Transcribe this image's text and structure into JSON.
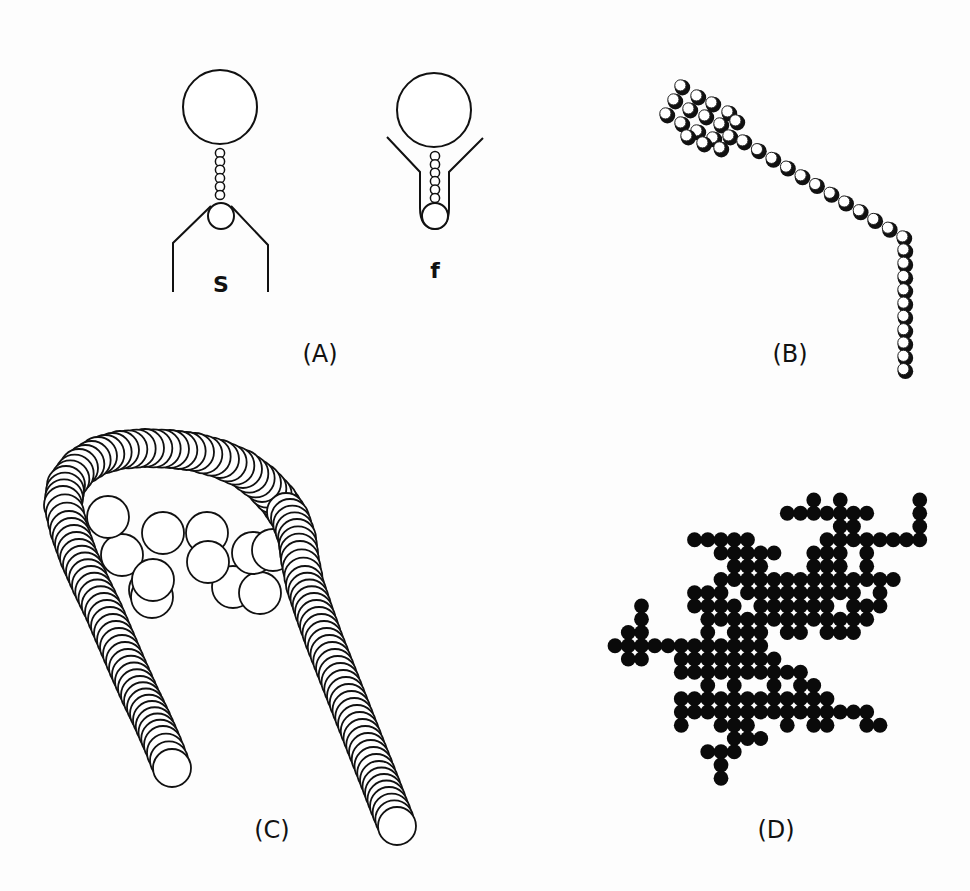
{
  "figure": {
    "stroke_color": "#111111",
    "fill_color": "#ffffff",
    "dot_color": "#0a0a0a",
    "background": "#fdfdfd"
  },
  "panels": {
    "A": {
      "label": "(A)",
      "label_pos": [
        320,
        362
      ],
      "figures": [
        {
          "sublabel": "S",
          "sublabel_pos": [
            221,
            292
          ],
          "head": {
            "cx": 220,
            "cy": 107,
            "r": 37
          },
          "neck_beads": {
            "x": 220,
            "y_start": 153,
            "y_step": 8.4,
            "count": 6,
            "r": 4.6
          },
          "base_bead": {
            "cx": 221,
            "cy": 216,
            "r": 13
          },
          "sheath_path": "M173,292 L173,243 L211,206 M268,292 L268,245 L231,206"
        },
        {
          "sublabel": "f",
          "sublabel_pos": [
            435,
            278
          ],
          "head": {
            "cx": 434,
            "cy": 110,
            "r": 37
          },
          "neck_beads": {
            "x": 435,
            "y_start": 156,
            "y_step": 8.4,
            "count": 6,
            "r": 4.6
          },
          "base_bead": {
            "cx": 435,
            "cy": 216,
            "r": 13
          },
          "sheath_path": "M387,137 L420,172 L420,208 Q420,228 435,229 M483,138 L449,172 L449,208 Q449,228 435,229"
        }
      ]
    },
    "B": {
      "label": "(B)",
      "label_pos": [
        790,
        362
      ],
      "bead_r": 7.2,
      "cluster_rows": [
        [
          [
            681,
            86
          ],
          [
            697,
            96
          ],
          [
            712,
            103
          ],
          [
            728,
            112
          ]
        ],
        [
          [
            674,
            100
          ],
          [
            689,
            109
          ],
          [
            705,
            116
          ],
          [
            720,
            124
          ],
          [
            736,
            121
          ]
        ],
        [
          [
            666,
            114
          ],
          [
            681,
            123
          ],
          [
            697,
            131
          ],
          [
            713,
            138
          ],
          [
            729,
            136
          ]
        ],
        [
          [
            687,
            136
          ],
          [
            703,
            143
          ],
          [
            720,
            148
          ]
        ]
      ],
      "chain_start": [
        743,
        141
      ],
      "chain_end": [
        903,
        237
      ],
      "chain_count": 12,
      "vertical_x": 904,
      "vertical_y_start": 250,
      "vertical_y_step": 13.3,
      "vertical_count": 10
    },
    "C": {
      "label": "(C)",
      "label_pos": [
        272,
        838
      ],
      "chain_r": 19,
      "chain_path": [
        [
          172,
          768
        ],
        [
          163,
          745
        ],
        [
          152,
          720
        ],
        [
          140,
          695
        ],
        [
          128,
          668
        ],
        [
          116,
          640
        ],
        [
          104,
          612
        ],
        [
          91,
          585
        ],
        [
          79,
          558
        ],
        [
          69,
          530
        ],
        [
          63,
          505
        ],
        [
          66,
          485
        ],
        [
          79,
          468
        ],
        [
          98,
          456
        ],
        [
          120,
          450
        ],
        [
          145,
          448
        ],
        [
          170,
          449
        ],
        [
          195,
          452
        ],
        [
          220,
          459
        ],
        [
          243,
          469
        ],
        [
          262,
          483
        ],
        [
          278,
          500
        ],
        [
          290,
          518
        ],
        [
          297,
          538
        ],
        [
          300,
          560
        ],
        [
          305,
          585
        ],
        [
          314,
          612
        ],
        [
          324,
          640
        ],
        [
          335,
          668
        ],
        [
          346,
          696
        ],
        [
          357,
          724
        ],
        [
          368,
          752
        ],
        [
          379,
          780
        ],
        [
          389,
          806
        ],
        [
          397,
          826
        ]
      ],
      "chain_step": 7.5,
      "cluster_r": 21,
      "cluster": [
        [
          150,
          590
        ],
        [
          163,
          533
        ],
        [
          207,
          533
        ],
        [
          233,
          587
        ],
        [
          260,
          593
        ],
        [
          152,
          597
        ],
        [
          122,
          555
        ],
        [
          108,
          517
        ],
        [
          153,
          580
        ],
        [
          208,
          562
        ],
        [
          253,
          553
        ],
        [
          273,
          550
        ]
      ]
    },
    "D": {
      "label": "(D)",
      "label_pos": [
        776,
        838
      ],
      "dot_r": 7.4,
      "origin": [
        615,
        500
      ],
      "step": 13.25,
      "rows": [
        {
          "j": 0,
          "cols": [
            15,
            17,
            23
          ]
        },
        {
          "j": 1,
          "cols": [
            13,
            14,
            15,
            16,
            17,
            18,
            19,
            23
          ]
        },
        {
          "j": 2,
          "cols": [
            17,
            18,
            23
          ]
        },
        {
          "j": 3,
          "cols": [
            6,
            7,
            8,
            9,
            10,
            16,
            17,
            18,
            19,
            20,
            21,
            22,
            23
          ]
        },
        {
          "j": 4,
          "cols": [
            8,
            9,
            10,
            11,
            12,
            15,
            16,
            17,
            19
          ]
        },
        {
          "j": 5,
          "cols": [
            9,
            10,
            11,
            15,
            16,
            17,
            19
          ]
        },
        {
          "j": 6,
          "cols": [
            8,
            9,
            10,
            11,
            12,
            13,
            14,
            15,
            16,
            17,
            18,
            19,
            20,
            21
          ]
        },
        {
          "j": 7,
          "cols": [
            6,
            7,
            8,
            10,
            11,
            12,
            13,
            14,
            15,
            16,
            17,
            18,
            20
          ]
        },
        {
          "j": 8,
          "cols": [
            2,
            6,
            7,
            8,
            9,
            11,
            12,
            13,
            14,
            15,
            16,
            18,
            19,
            20
          ]
        },
        {
          "j": 9,
          "cols": [
            2,
            7,
            8,
            9,
            10,
            11,
            12,
            13,
            14,
            15,
            16,
            17,
            18,
            19
          ]
        },
        {
          "j": 10,
          "cols": [
            1,
            2,
            7,
            9,
            10,
            11,
            13,
            14,
            16,
            17,
            18
          ]
        },
        {
          "j": 11,
          "cols": [
            0,
            1,
            2,
            3,
            4,
            5,
            6,
            7,
            8,
            9,
            10,
            11
          ]
        },
        {
          "j": 12,
          "cols": [
            1,
            2,
            5,
            6,
            7,
            8,
            9,
            10,
            11,
            12
          ]
        },
        {
          "j": 13,
          "cols": [
            5,
            6,
            7,
            8,
            9,
            10,
            11,
            12,
            13,
            14
          ]
        },
        {
          "j": 14,
          "cols": [
            7,
            9,
            12,
            14,
            15
          ]
        },
        {
          "j": 15,
          "cols": [
            5,
            6,
            7,
            8,
            9,
            10,
            11,
            12,
            13,
            14,
            15,
            16
          ]
        },
        {
          "j": 16,
          "cols": [
            5,
            6,
            7,
            8,
            9,
            10,
            11,
            12,
            13,
            14,
            15,
            16,
            17,
            18,
            19
          ]
        },
        {
          "j": 17,
          "cols": [
            5,
            8,
            9,
            10,
            13,
            15,
            16,
            19,
            20
          ]
        },
        {
          "j": 18,
          "cols": [
            9,
            10,
            11
          ]
        },
        {
          "j": 19,
          "cols": [
            7,
            8,
            9
          ]
        },
        {
          "j": 20,
          "cols": [
            8
          ]
        },
        {
          "j": 21,
          "cols": [
            8
          ]
        }
      ]
    }
  }
}
